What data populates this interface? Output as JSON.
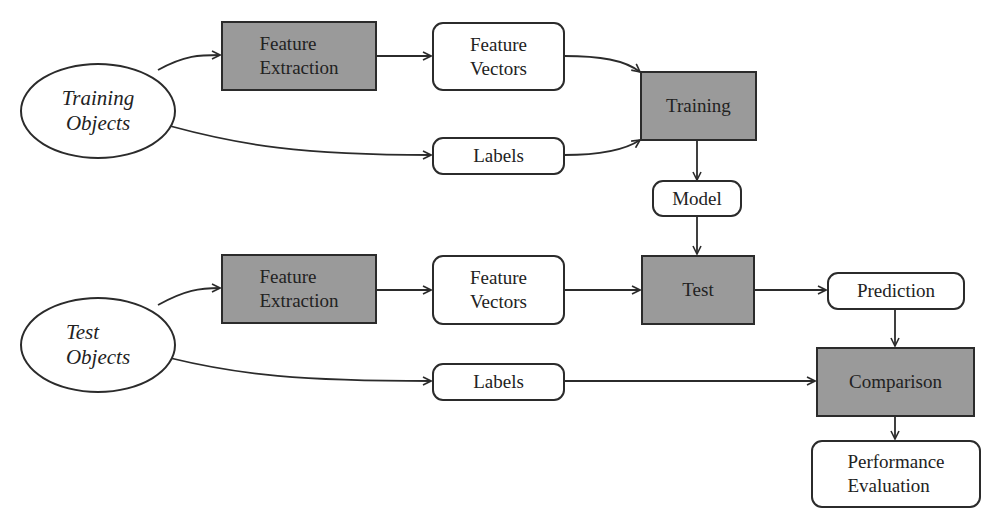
{
  "diagram": {
    "colors": {
      "process_fill": "#9a9a9a",
      "data_fill": "#ffffff",
      "stroke": "#2b2b2b",
      "text": "#222222"
    },
    "nodes": {
      "training_objects": {
        "label": "Training\nObjects",
        "shape": "ellipse"
      },
      "test_objects": {
        "label": "Test\nObjects",
        "shape": "ellipse"
      },
      "fe_train": {
        "label": "Feature\nExtraction",
        "shape": "process"
      },
      "fv_train": {
        "label": "Feature\nVectors",
        "shape": "data"
      },
      "labels_train": {
        "label": "Labels",
        "shape": "data"
      },
      "training": {
        "label": "Training",
        "shape": "process"
      },
      "model": {
        "label": "Model",
        "shape": "data"
      },
      "fe_test": {
        "label": "Feature\nExtraction",
        "shape": "process"
      },
      "fv_test": {
        "label": "Feature\nVectors",
        "shape": "data"
      },
      "test": {
        "label": "Test",
        "shape": "process"
      },
      "prediction": {
        "label": "Prediction",
        "shape": "data"
      },
      "labels_test": {
        "label": "Labels",
        "shape": "data"
      },
      "comparison": {
        "label": "Comparison",
        "shape": "process"
      },
      "performance": {
        "label": "Performance\nEvaluation",
        "shape": "data"
      }
    },
    "edges": [
      [
        "training_objects",
        "fe_train"
      ],
      [
        "fe_train",
        "fv_train"
      ],
      [
        "fv_train",
        "training"
      ],
      [
        "training_objects",
        "labels_train"
      ],
      [
        "labels_train",
        "training"
      ],
      [
        "training",
        "model"
      ],
      [
        "model",
        "test"
      ],
      [
        "test_objects",
        "fe_test"
      ],
      [
        "fe_test",
        "fv_test"
      ],
      [
        "fv_test",
        "test"
      ],
      [
        "test",
        "prediction"
      ],
      [
        "test_objects",
        "labels_test"
      ],
      [
        "prediction",
        "comparison"
      ],
      [
        "labels_test",
        "comparison"
      ],
      [
        "comparison",
        "performance"
      ]
    ]
  }
}
